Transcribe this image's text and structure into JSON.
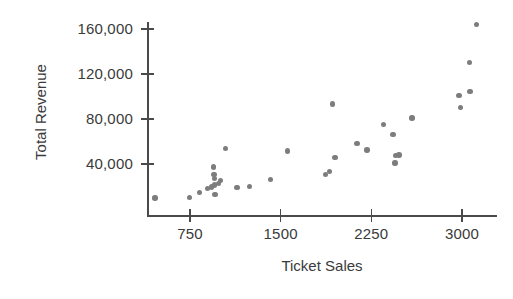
{
  "chart_data": {
    "type": "scatter",
    "title": "",
    "xlabel": "Ticket Sales",
    "ylabel": "Total Revenue",
    "xlim": [
      350,
      3250
    ],
    "ylim": [
      0,
      175000
    ],
    "xticks": [
      750,
      1500,
      2250,
      3000
    ],
    "xtick_labels": [
      "750",
      "1500",
      "2250",
      "3000"
    ],
    "yticks": [
      40000,
      80000,
      120000,
      160000
    ],
    "ytick_labels": [
      "40,000",
      "80,000",
      "120,000",
      "160,000"
    ],
    "grid": false,
    "legend": null,
    "marker_color": "#7d7d7d",
    "axis_color": "#4a4a4a",
    "points": [
      {
        "x": 460,
        "y": 9800
      },
      {
        "x": 745,
        "y": 10200
      },
      {
        "x": 830,
        "y": 14500
      },
      {
        "x": 895,
        "y": 18200
      },
      {
        "x": 930,
        "y": 19500
      },
      {
        "x": 945,
        "y": 37500
      },
      {
        "x": 950,
        "y": 30500
      },
      {
        "x": 952,
        "y": 27000
      },
      {
        "x": 955,
        "y": 21500
      },
      {
        "x": 958,
        "y": 12800
      },
      {
        "x": 985,
        "y": 22500
      },
      {
        "x": 1000,
        "y": 25500
      },
      {
        "x": 1045,
        "y": 54000
      },
      {
        "x": 1140,
        "y": 19000
      },
      {
        "x": 1240,
        "y": 19800
      },
      {
        "x": 1415,
        "y": 26500
      },
      {
        "x": 1555,
        "y": 51500
      },
      {
        "x": 1870,
        "y": 30500
      },
      {
        "x": 1905,
        "y": 33500
      },
      {
        "x": 1930,
        "y": 93500
      },
      {
        "x": 1950,
        "y": 46000
      },
      {
        "x": 2130,
        "y": 58500
      },
      {
        "x": 2215,
        "y": 52500
      },
      {
        "x": 2350,
        "y": 75000
      },
      {
        "x": 2430,
        "y": 66500
      },
      {
        "x": 2445,
        "y": 41000
      },
      {
        "x": 2450,
        "y": 47500
      },
      {
        "x": 2480,
        "y": 48000
      },
      {
        "x": 2585,
        "y": 81000
      },
      {
        "x": 2975,
        "y": 101000
      },
      {
        "x": 2990,
        "y": 90000
      },
      {
        "x": 3060,
        "y": 130000
      },
      {
        "x": 3065,
        "y": 104500
      },
      {
        "x": 3120,
        "y": 164000
      }
    ]
  }
}
